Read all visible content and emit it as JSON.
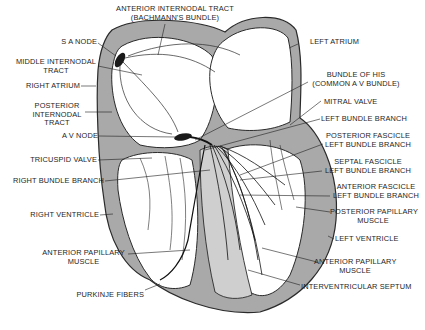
{
  "diagram": {
    "colors": {
      "background": "#ffffff",
      "wall_fill": "#a8a8a8",
      "wall_stroke": "#2a2a2a",
      "node_fill": "#1a1a1a",
      "label_text": "#1e1e1e"
    },
    "labels": {
      "anterior_internodal": [
        "ANTERIOR INTERNODAL TRACT",
        "(BACHMANN'S BUNDLE)"
      ],
      "sa_node": [
        "S A NODE"
      ],
      "middle_internodal": [
        "MIDDLE INTERNODAL",
        "TRACT"
      ],
      "right_atrium": [
        "RIGHT ATRIUM"
      ],
      "posterior_internodal": [
        "POSTERIOR",
        "INTERNODAL",
        "TRACT"
      ],
      "av_node": [
        "A V NODE"
      ],
      "tricuspid_valve": [
        "TRICUSPID VALVE"
      ],
      "right_bundle_branch": [
        "RIGHT BUNDLE BRANCH"
      ],
      "right_ventricle": [
        "RIGHT VENTRICLE"
      ],
      "anterior_papillary_right": [
        "ANTERIOR PAPILLARY",
        "MUSCLE"
      ],
      "purkinje_fibers": [
        "PURKINJE FIBERS"
      ],
      "left_atrium": [
        "LEFT ATRIUM"
      ],
      "bundle_of_his": [
        "BUNDLE OF HIS",
        "(COMMON A V BUNDLE)"
      ],
      "mitral_valve": [
        "MITRAL VALVE"
      ],
      "left_bundle_branch": [
        "LEFT BUNDLE BRANCH"
      ],
      "posterior_fascicle": [
        "POSTERIOR FASCICLE",
        "LEFT BUNDLE BRANCH"
      ],
      "septal_fascicle": [
        "SEPTAL FASCICLE",
        "LEFT BUNDLE BRANCH"
      ],
      "anterior_fascicle": [
        "ANTERIOR FASCICLE",
        "LEFT BUNDLE BRANCH"
      ],
      "posterior_papillary": [
        "POSTERIOR PAPILLARY",
        "MUSCLE"
      ],
      "left_ventricle": [
        "LEFT VENTRICLE"
      ],
      "anterior_papillary_left": [
        "ANTERIOR PAPILLARY",
        "MUSCLE"
      ],
      "interventricular_septum": [
        "INTERVENTRICULAR SEPTUM"
      ]
    }
  }
}
